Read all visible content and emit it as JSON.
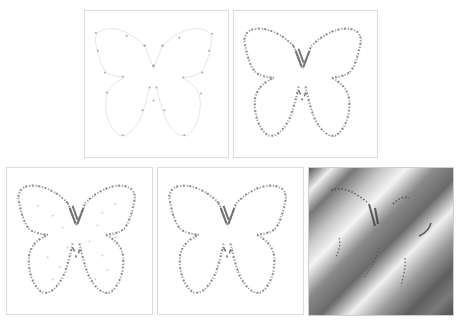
{
  "figure": {
    "layout": "two rows: 2 panels on top, 3 panels on bottom",
    "panels": [
      {
        "id": "p1",
        "content": "sparse control points on faint butterfly outline",
        "style": "light"
      },
      {
        "id": "p2",
        "content": "dense stippled butterfly contour",
        "style": "stippled"
      },
      {
        "id": "p3",
        "content": "stippled butterfly contour with scattered interior dots",
        "style": "stippled-noisy"
      },
      {
        "id": "p4",
        "content": "stippled butterfly contour",
        "style": "stippled"
      },
      {
        "id": "p5",
        "content": "butterfly contour fragments over diagonal striped gradient texture",
        "style": "textured"
      }
    ],
    "colors": {
      "outline_light": "#d8d8d8",
      "stipple": "#8a8a8a",
      "stipple_dark": "#6e6e6e",
      "border": "#dcdcdc",
      "texture_dark": "#5a5a5a",
      "texture_light": "#f2f2f2"
    }
  }
}
